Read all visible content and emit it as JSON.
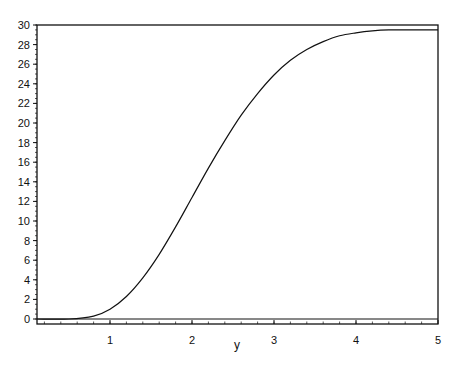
{
  "chart_data": {
    "type": "line",
    "title": "",
    "xlabel": "y",
    "ylabel": "",
    "xlim": [
      0.1,
      5
    ],
    "ylim": [
      -0.5,
      30
    ],
    "grid": false,
    "legend": null,
    "x_ticks": [
      1,
      2,
      3,
      4,
      5
    ],
    "y_ticks": [
      0,
      2,
      4,
      6,
      8,
      10,
      12,
      14,
      16,
      18,
      20,
      22,
      24,
      26,
      28,
      30
    ],
    "series": [
      {
        "name": "curve",
        "color": "#111111",
        "x": [
          0.1,
          0.5,
          0.8,
          1.0,
          1.2,
          1.4,
          1.6,
          1.8,
          2.0,
          2.2,
          2.4,
          2.6,
          2.8,
          3.0,
          3.2,
          3.4,
          3.6,
          3.8,
          4.0,
          4.2,
          4.4,
          4.6,
          4.8,
          5.0
        ],
        "y": [
          0.0,
          0.0,
          0.3,
          1.0,
          2.3,
          4.2,
          6.6,
          9.4,
          12.4,
          15.4,
          18.2,
          20.8,
          23.0,
          24.9,
          26.4,
          27.5,
          28.3,
          28.9,
          29.2,
          29.4,
          29.5,
          29.5,
          29.5,
          29.5
        ]
      }
    ]
  }
}
